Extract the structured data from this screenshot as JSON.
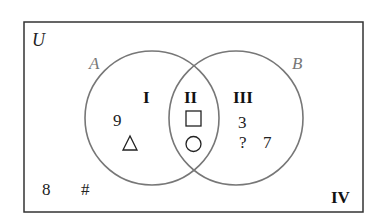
{
  "diagram": {
    "type": "venn",
    "universal_label": "U",
    "sets": [
      {
        "name": "A",
        "label": "A"
      },
      {
        "name": "B",
        "label": "B"
      }
    ],
    "regions": [
      {
        "id": "I",
        "label": "I",
        "elements": [
          "9",
          "△"
        ]
      },
      {
        "id": "II",
        "label": "II",
        "elements": [
          "□",
          "○"
        ]
      },
      {
        "id": "III",
        "label": "III",
        "elements": [
          "3",
          "?",
          "7"
        ]
      },
      {
        "id": "IV",
        "label": "IV",
        "elements": [
          "8",
          "#"
        ]
      }
    ],
    "colors": {
      "border": "#333333",
      "circle": "#777777",
      "set_label": "#777777"
    }
  }
}
